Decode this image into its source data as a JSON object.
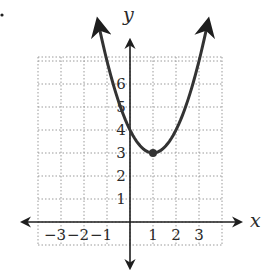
{
  "chart_data": {
    "type": "line",
    "title": "",
    "function": "y = (x - 1)^2 + 3",
    "xlabel": "x",
    "ylabel": "y",
    "xlim": [
      -4,
      4
    ],
    "ylim": [
      -1,
      7
    ],
    "grid": true,
    "x_ticks": [
      -3,
      -2,
      -1,
      1,
      2,
      3
    ],
    "x_tick_labels": [
      "−3",
      "−2",
      "−1",
      "1",
      "2",
      "3"
    ],
    "y_ticks": [
      1,
      2,
      3,
      4,
      5,
      6
    ],
    "y_tick_labels": [
      "1",
      "2",
      "3",
      "4",
      "5",
      "6"
    ],
    "series": [
      {
        "name": "parabola",
        "x": [
          -1.4,
          -1,
          0,
          1,
          2,
          3,
          3.4
        ],
        "y": [
          8.76,
          7,
          4,
          3,
          4,
          7,
          8.76
        ],
        "color": "#333333",
        "arrows_at_ends": true
      }
    ],
    "points": [
      {
        "label": "vertex",
        "x": 1,
        "y": 3
      }
    ],
    "legend": null
  },
  "problem_marker": "."
}
